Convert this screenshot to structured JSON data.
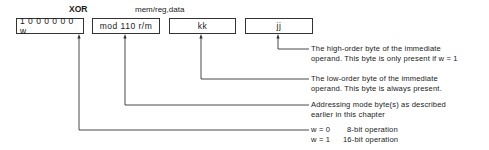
{
  "header": {
    "instruction": "XOR",
    "operand_type": "mem/reg,data"
  },
  "fields": [
    {
      "label": "1 0 0 0 0 0 0 w",
      "name": "opcode-byte"
    },
    {
      "label": "mod 110 r/m",
      "name": "addressing-byte"
    },
    {
      "label": "kk",
      "name": "low-data-byte"
    },
    {
      "label": "jj",
      "name": "high-data-byte"
    }
  ],
  "descriptions": {
    "jj": {
      "line1": "The high-order byte of the immediate",
      "line2": "operand. This byte is only present if w = 1"
    },
    "kk": {
      "line1": "The low-order byte of the immediate",
      "line2": "operand. This byte is always present."
    },
    "mod": {
      "line1": "Addressing mode byte(s) as described",
      "line2": "earlier in this chapter"
    },
    "w": [
      {
        "eq": "w = 0",
        "meaning": "8-bit operation"
      },
      {
        "eq": "w = 1",
        "meaning": "16-bit operation"
      }
    ]
  }
}
